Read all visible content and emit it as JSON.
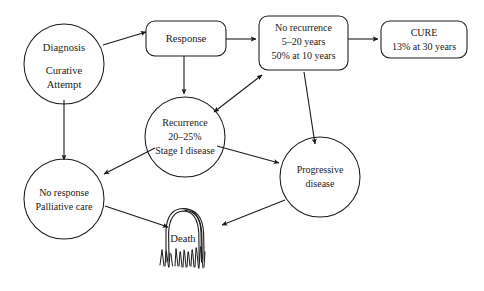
{
  "diagram": {
    "background_color": "#ffffff",
    "stroke_color": "#1a1a1a",
    "nodes": [
      {
        "id": "diagnosis",
        "shape": "circle",
        "lines": [
          "Diagnosis",
          "",
          "Curative",
          "Attempt"
        ]
      },
      {
        "id": "response",
        "shape": "rounded-rect",
        "lines": [
          "Response"
        ]
      },
      {
        "id": "no-recurrence",
        "shape": "rounded-rect",
        "lines": [
          "No recurrence",
          "5–20 years",
          "50% at 10 years"
        ]
      },
      {
        "id": "cure",
        "shape": "rounded-rect",
        "lines": [
          "CURE",
          "13% at 30 years"
        ]
      },
      {
        "id": "recurrence",
        "shape": "circle",
        "lines": [
          "Recurrence",
          "20–25%",
          "Stage I disease"
        ]
      },
      {
        "id": "progressive-disease",
        "shape": "circle",
        "lines": [
          "Progressive",
          "disease"
        ]
      },
      {
        "id": "no-response",
        "shape": "circle",
        "lines": [
          "No response",
          "Palliative care"
        ]
      },
      {
        "id": "death",
        "shape": "tombstone",
        "lines": [
          "Death"
        ]
      }
    ],
    "edges": [
      {
        "id": "diagnosis-to-response",
        "from": "diagnosis",
        "to": "response",
        "arrow": "single"
      },
      {
        "id": "response-to-no-recurrence",
        "from": "response",
        "to": "no-recurrence",
        "arrow": "single"
      },
      {
        "id": "no-recurrence-to-cure",
        "from": "no-recurrence",
        "to": "cure",
        "arrow": "single"
      },
      {
        "id": "response-to-recurrence",
        "from": "response",
        "to": "recurrence",
        "arrow": "single"
      },
      {
        "id": "recurrence-no-recurrence",
        "from": "recurrence",
        "to": "no-recurrence",
        "arrow": "double"
      },
      {
        "id": "no-recurrence-to-progressive",
        "from": "no-recurrence",
        "to": "progressive-disease",
        "arrow": "single"
      },
      {
        "id": "recurrence-to-progressive",
        "from": "recurrence",
        "to": "progressive-disease",
        "arrow": "single"
      },
      {
        "id": "recurrence-to-no-response",
        "from": "recurrence",
        "to": "no-response",
        "arrow": "single"
      },
      {
        "id": "diagnosis-to-no-response",
        "from": "diagnosis",
        "to": "no-response",
        "arrow": "single"
      },
      {
        "id": "no-response-to-death",
        "from": "no-response",
        "to": "death",
        "arrow": "single"
      },
      {
        "id": "progressive-to-death",
        "from": "progressive-disease",
        "to": "death",
        "arrow": "single"
      }
    ],
    "node_labels": {
      "diagnosis_l1": "Diagnosis",
      "diagnosis_l2": "Curative",
      "diagnosis_l3": "Attempt",
      "response_l1": "Response",
      "no_recurrence_l1": "No recurrence",
      "no_recurrence_l2": "5–20 years",
      "no_recurrence_l3": "50% at 10 years",
      "cure_l1": "CURE",
      "cure_l2": "13% at 30 years",
      "recurrence_l1": "Recurrence",
      "recurrence_l2": "20–25%",
      "recurrence_l3": "Stage I disease",
      "progressive_l1": "Progressive",
      "progressive_l2": "disease",
      "no_response_l1": "No response",
      "no_response_l2": "Palliative care",
      "death_l1": "Death"
    }
  }
}
